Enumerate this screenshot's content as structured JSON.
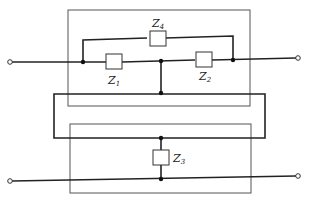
{
  "diagram": {
    "type": "circuit",
    "components": [
      {
        "id": "Z1",
        "label": "Z",
        "subscript": "1"
      },
      {
        "id": "Z2",
        "label": "Z",
        "subscript": "2"
      },
      {
        "id": "Z3",
        "label": "Z",
        "subscript": "3"
      },
      {
        "id": "Z4",
        "label": "Z",
        "subscript": "4"
      }
    ],
    "terminals": [
      "top-left",
      "top-right",
      "bottom-left",
      "bottom-right"
    ],
    "colors": {
      "line": "#222222",
      "box": "#555555",
      "background": "#ffffff"
    }
  }
}
